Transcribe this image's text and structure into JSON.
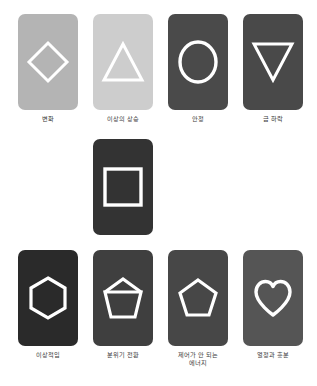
{
  "background_color": "#ffffff",
  "shape_stroke_color": "#ffffff",
  "label_color": "#3b3b3b",
  "rows": {
    "top": {
      "cards": [
        {
          "label": "변화",
          "shape": "diamond-icon",
          "card_color": "#b4b4b4",
          "stroke_color": "#ffffff"
        },
        {
          "label": "이상의 상승",
          "shape": "triangle-up-icon",
          "card_color": "#cdcdcd",
          "stroke_color": "#ffffff"
        },
        {
          "label": "안정",
          "shape": "circle-icon",
          "card_color": "#4a4a4a",
          "stroke_color": "#ffffff"
        },
        {
          "label": "급 하락",
          "shape": "triangle-down-icon",
          "card_color": "#494949",
          "stroke_color": "#ffffff"
        }
      ]
    },
    "middle": {
      "cards": [
        {
          "label": "",
          "shape": "square-icon",
          "card_color": "#333333",
          "stroke_color": "#ffffff"
        }
      ]
    },
    "bottom": {
      "cards": [
        {
          "label": "이상적임",
          "shape": "hexagon-icon",
          "card_color": "#2a2a2a",
          "stroke_color": "#ffffff"
        },
        {
          "label": "분위기 전환",
          "shape": "pentagon-down-icon",
          "card_color": "#3f3f3f",
          "stroke_color": "#ffffff"
        },
        {
          "label": "제어가 안 되는\n에너지",
          "shape": "pentagon-up-icon",
          "card_color": "#474747",
          "stroke_color": "#ffffff"
        },
        {
          "label": "열정과 흥분",
          "shape": "heart-icon",
          "card_color": "#555555",
          "stroke_color": "#ffffff"
        }
      ]
    }
  }
}
